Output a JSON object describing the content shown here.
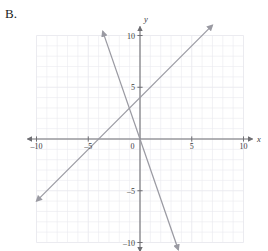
{
  "label": {
    "text": "B."
  },
  "colors": {
    "grid": "#e9e9ee",
    "axis": "#6e6e73",
    "line": "#9a9aa2",
    "text": "#3a3a3a",
    "background": "#ffffff"
  },
  "axes": {
    "x_name": "x",
    "y_name": "y",
    "x_ticks": [
      {
        "value": -10,
        "label": "–10"
      },
      {
        "value": -5,
        "label": "–5"
      },
      {
        "value": 0,
        "label": "0"
      },
      {
        "value": 5,
        "label": "5"
      },
      {
        "value": 10,
        "label": "10"
      }
    ],
    "y_ticks": [
      {
        "value": 10,
        "label": "10"
      },
      {
        "value": 5,
        "label": "5"
      },
      {
        "value": -5,
        "label": "–5"
      },
      {
        "value": -10,
        "label": "–10"
      }
    ]
  },
  "chart_data": {
    "type": "line",
    "title": "",
    "xlabel": "x",
    "ylabel": "y",
    "xlim": [
      -10,
      10
    ],
    "ylim": [
      -10,
      10
    ],
    "grid": true,
    "grid_step": 1,
    "legend": "none",
    "series": [
      {
        "name": "ascending-line",
        "slope": 1,
        "intercept": 4,
        "x": [
          -10.0,
          7.0
        ],
        "y": [
          -6.0,
          11.0
        ],
        "arrow_start": true,
        "arrow_end": true
      },
      {
        "name": "descending-line",
        "slope": -2.9,
        "intercept": 0,
        "x": [
          -3.6,
          3.7
        ],
        "y": [
          10.4,
          -10.7
        ],
        "arrow_start": true,
        "arrow_end": true
      }
    ]
  }
}
